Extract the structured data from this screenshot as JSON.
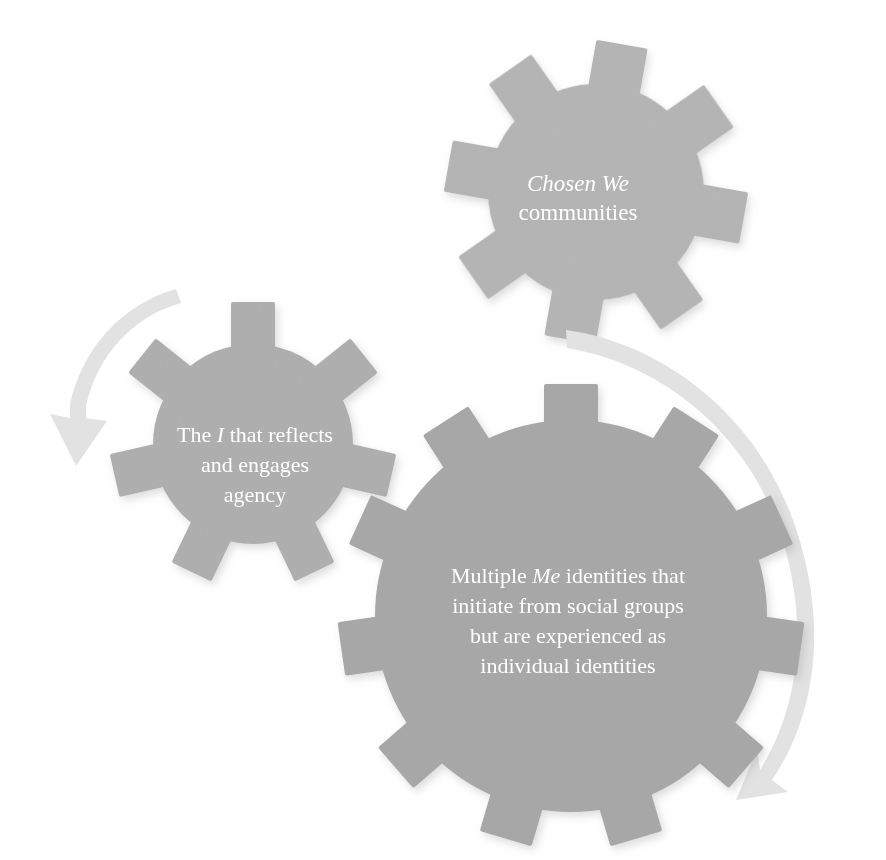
{
  "figure": {
    "background_color": "#ffffff",
    "width": 886,
    "height": 860
  },
  "palette": {
    "gear_top": "#b6b6b6",
    "gear_left": "#b0b0b0",
    "gear_main": "#a9a9a9",
    "arrow": "#e2e2e2",
    "label_text": "#ffffff"
  },
  "nodes": [
    {
      "id": "chosen-we-gear",
      "name": "Chosen We communities",
      "shape": "gear",
      "teeth": 8,
      "color": "#b6b6b6",
      "center": {
        "x": 596,
        "y": 192
      },
      "radius": 118,
      "rotation_deg": 8,
      "lines": [
        {
          "text": "Chosen We",
          "style": "italic"
        },
        {
          "text": "communities",
          "style": "normal"
        }
      ]
    },
    {
      "id": "i-agency-gear",
      "name": "The I that reflects and engages agency",
      "shape": "gear",
      "teeth": 7,
      "color": "#b0b0b0",
      "center": {
        "x": 253,
        "y": 444
      },
      "radius": 108,
      "rotation_deg": 0,
      "lines": [
        {
          "text": "The ",
          "style": "normal",
          "em": "I",
          "tail": " that reflects"
        },
        {
          "text": "and engages",
          "style": "normal"
        },
        {
          "text": "agency",
          "style": "normal"
        }
      ]
    },
    {
      "id": "multiple-me-gear",
      "name": "Multiple Me identities that initiate from social groups but are experienced as individual identities",
      "shape": "gear",
      "teeth": 11,
      "color": "#a9a9a9",
      "center": {
        "x": 571,
        "y": 616
      },
      "radius": 200,
      "rotation_deg": 0,
      "lines": [
        {
          "text": "Multiple ",
          "style": "normal",
          "em": "Me",
          "tail": " identities that"
        },
        {
          "text": "initiate from social groups",
          "style": "normal"
        },
        {
          "text": "but are experienced as",
          "style": "normal"
        },
        {
          "text": "individual identities",
          "style": "normal"
        }
      ]
    }
  ],
  "connectors": [
    {
      "id": "arrow-left",
      "name": "curved arrow from Chosen We toward The I gear",
      "color": "#e2e2e2",
      "direction": "clockwise-down-left",
      "from": "chosen-we-gear",
      "to": "i-agency-gear",
      "arrowhead": "down"
    },
    {
      "id": "arrow-right",
      "name": "large curved arrow from Chosen We around to Multiple Me gear",
      "color": "#e2e2e2",
      "direction": "clockwise-around-right",
      "from": "chosen-we-gear",
      "to": "multiple-me-gear",
      "arrowhead": "down-left"
    }
  ],
  "text": {
    "chosen_we_line1": "Chosen We",
    "chosen_we_line2": "communities",
    "i_line1_a": "The ",
    "i_line1_em": "I",
    "i_line1_b": " that reflects",
    "i_line2": "and engages",
    "i_line3": "agency",
    "me_line1_a": "Multiple ",
    "me_line1_em": "Me",
    "me_line1_b": " identities that",
    "me_line2": "initiate from social groups",
    "me_line3": "but are experienced as",
    "me_line4": "individual identities"
  }
}
